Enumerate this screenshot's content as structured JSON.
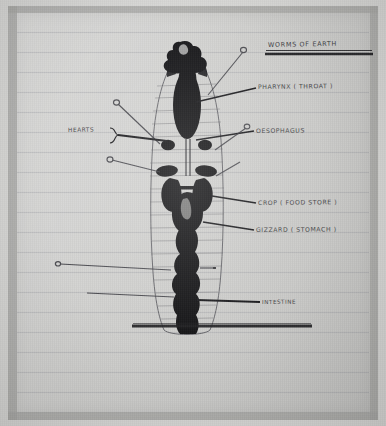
{
  "document": {
    "title": "WORMS OF EARTH",
    "medium": "hand-drawn pencil diagram on lined notebook paper",
    "subject": "earthworm internal anatomy"
  },
  "labels": {
    "pharynx": "PHARYNX ( THROAT )",
    "oesophagus": "OESOPHAGUS",
    "crop": "CROP ( FOOD STORE )",
    "gizzard": "GIZZARD ( STOMACH )",
    "intestine": "INTESTINE",
    "hearts": "HEARTS"
  },
  "colors": {
    "paper": "#cfcfcd",
    "ink": "#141416",
    "pencil": "#3b3b40",
    "rule_line": "#787a87",
    "frame": "#a8a8a6"
  },
  "figure": {
    "body_outline": "elongated tapered worm body, vertical, segmented with cross ruling",
    "organs": [
      "head / prostomium (dark scribble at top)",
      "pharynx (large dark elongated oval)",
      "paired hearts (round dark blobs, two rows)",
      "oesophagus (narrow tube between heart pairs)",
      "crop (dark lobed sac)",
      "gizzard (dark rounded mass)",
      "intestine (long dark irregular tube running to tail)"
    ],
    "underline": "title is underlined with a heavy double rule",
    "bottom_rule": "thick horizontal bar drawn beneath the figure"
  }
}
